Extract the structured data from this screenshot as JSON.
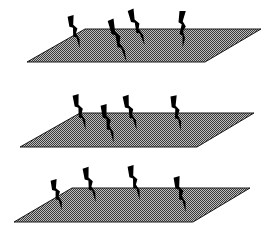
{
  "diagram": {
    "background": "#ffffff",
    "plane_fill_dark": "#3a3a3a",
    "plane_fill_light": "#bdbdbd",
    "plane_edge": "#1a1a1a",
    "bolt_color": "#000000",
    "planes": [
      {
        "name": "plane-1",
        "points": [
          [
            85,
            29
          ],
          [
            261,
            29
          ],
          [
            205,
            62
          ],
          [
            27,
            62
          ]
        ],
        "bolts": [
          {
            "top": [
              70,
              16
            ],
            "bottom": [
              80,
              48
            ]
          },
          {
            "top": [
              110,
              20
            ],
            "bottom": [
              127,
              62
            ]
          },
          {
            "top": [
              130,
              10
            ],
            "bottom": [
              145,
              45
            ]
          },
          {
            "top": [
              182,
              11
            ],
            "bottom": [
              183,
              48
            ]
          }
        ]
      },
      {
        "name": "plane-2",
        "points": [
          [
            80,
            113
          ],
          [
            254,
            113
          ],
          [
            197,
            147
          ],
          [
            20,
            147
          ]
        ],
        "bolts": [
          {
            "top": [
              75,
              95
            ],
            "bottom": [
              86,
              130
            ]
          },
          {
            "top": [
              103,
              105
            ],
            "bottom": [
              114,
              143
            ]
          },
          {
            "top": [
              125,
              96
            ],
            "bottom": [
              137,
              130
            ]
          },
          {
            "top": [
              173,
              96
            ],
            "bottom": [
              181,
              131
            ]
          }
        ]
      },
      {
        "name": "plane-3",
        "points": [
          [
            72,
            188
          ],
          [
            250,
            188
          ],
          [
            193,
            222
          ],
          [
            14,
            222
          ]
        ],
        "bolts": [
          {
            "top": [
              53,
              180
            ],
            "bottom": [
              62,
              210
            ]
          },
          {
            "top": [
              85,
              168
            ],
            "bottom": [
              96,
              202
            ]
          },
          {
            "top": [
              130,
              166
            ],
            "bottom": [
              140,
              200
            ]
          },
          {
            "top": [
              176,
              177
            ],
            "bottom": [
              186,
              212
            ]
          }
        ]
      }
    ]
  }
}
